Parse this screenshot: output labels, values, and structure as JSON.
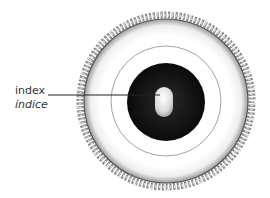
{
  "diagram": {
    "labels": [
      {
        "id": "index",
        "text": "index",
        "translation": "índice"
      }
    ],
    "colors": {
      "background": "#ffffff",
      "outer_ring_fill": "#f2f2f2",
      "beads": "#cfcfcf",
      "inner_thin_ring": "#777777",
      "core": "#111111",
      "pill": "#e8e8e8",
      "leader_line": "#222222",
      "text": "#333333"
    }
  }
}
